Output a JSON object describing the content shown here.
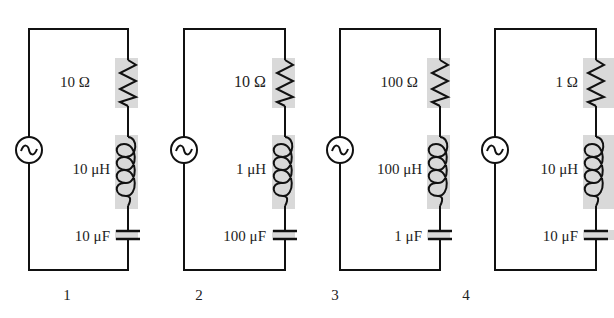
{
  "diagram": {
    "colors": {
      "wire": "#111111",
      "shading": "#d9d9d9",
      "background": "#ffffff"
    },
    "circuits": [
      {
        "number": "1",
        "resistance": "10 Ω",
        "inductance": "10 μH",
        "capacitance": "10 μF"
      },
      {
        "number": "2",
        "resistance": "10 Ω",
        "inductance": "1 μH",
        "capacitance": "100 μF"
      },
      {
        "number": "3",
        "resistance": "100 Ω",
        "inductance": "100 μH",
        "capacitance": "1 μF"
      },
      {
        "number": "4",
        "resistance": "1 Ω",
        "inductance": "10 μH",
        "capacitance": "10 μF"
      }
    ],
    "icons": {
      "source": "ac-source-icon",
      "resistor": "resistor-icon",
      "inductor": "inductor-icon",
      "capacitor": "capacitor-icon"
    }
  }
}
